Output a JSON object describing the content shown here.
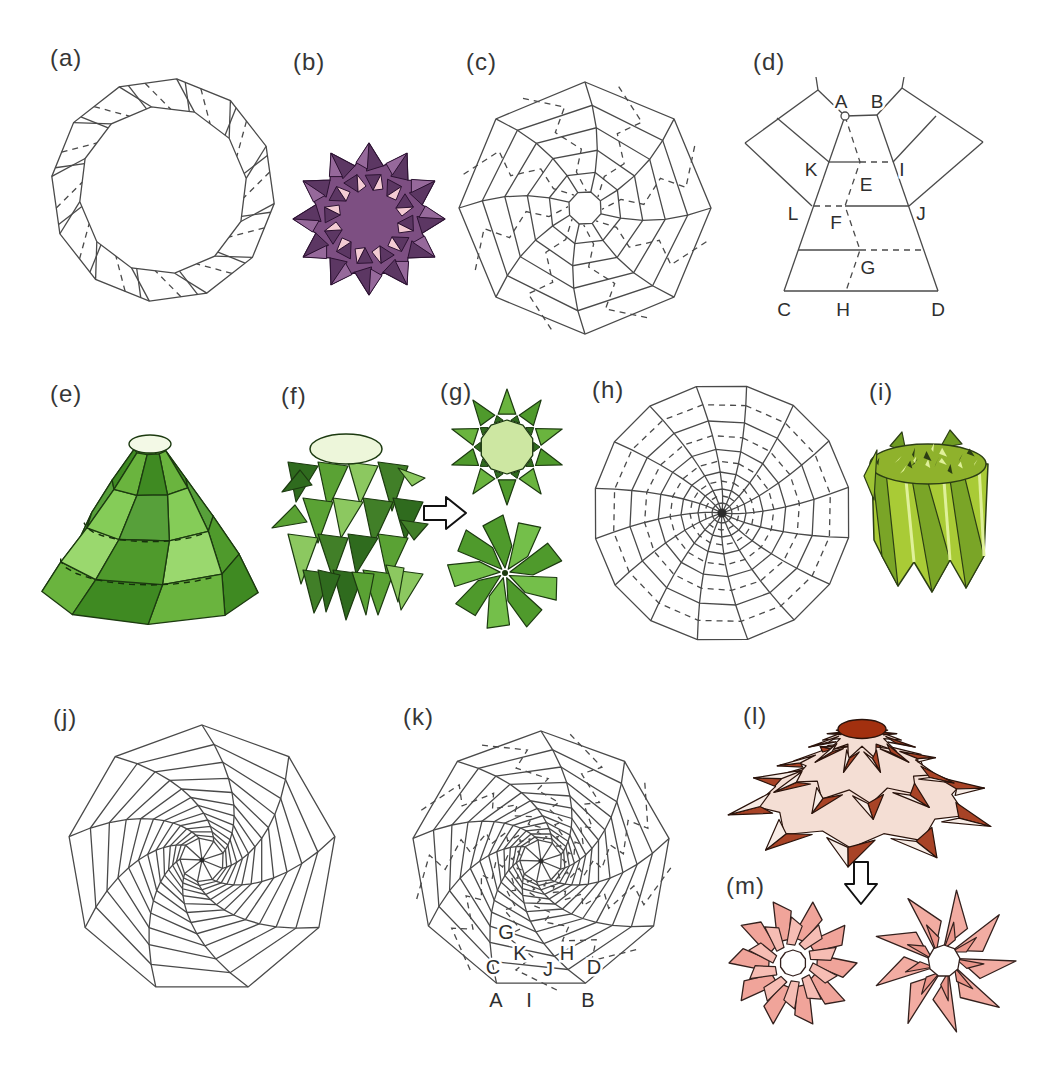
{
  "figure": {
    "background": "#ffffff",
    "line_color": "#4a4a4a",
    "label_color": "#363636"
  },
  "panels": {
    "a": {
      "label": "(a)",
      "type": "crease-pattern-dodecagon-ring"
    },
    "b": {
      "label": "(b)",
      "type": "folded-ring-model"
    },
    "c": {
      "label": "(c)",
      "type": "crease-pattern-octagon-web"
    },
    "d": {
      "label": "(d)",
      "type": "crease-unit-detail-diagram"
    },
    "e": {
      "label": "(e)",
      "type": "folded-cone-model"
    },
    "f": {
      "label": "(f)",
      "type": "folded-tower-model"
    },
    "g": {
      "label": "(g)",
      "type": "flattened-star-and-pinwheel-models"
    },
    "h": {
      "label": "(h)",
      "type": "crease-pattern-circular-web"
    },
    "i": {
      "label": "(i)",
      "type": "folded-cylinder-model"
    },
    "j": {
      "label": "(j)",
      "type": "crease-pattern-spiral-web"
    },
    "k": {
      "label": "(k)",
      "type": "crease-pattern-spiral-web-labeled"
    },
    "l": {
      "label": "(l)",
      "type": "folded-dome-model"
    },
    "m": {
      "label": "(m)",
      "type": "flattened-flower-models"
    }
  },
  "icons": {
    "flatten_arrow_right": "hollow-right-arrow",
    "flatten_arrow_down": "hollow-down-arrow"
  },
  "diagram_d": {
    "circle_marker_at": "A",
    "points": [
      {
        "t": "A",
        "x": 841,
        "y": 103
      },
      {
        "t": "B",
        "x": 877,
        "y": 103
      },
      {
        "t": "K",
        "x": 811,
        "y": 171
      },
      {
        "t": "E",
        "x": 866,
        "y": 186
      },
      {
        "t": "I",
        "x": 902,
        "y": 171
      },
      {
        "t": "L",
        "x": 793,
        "y": 215
      },
      {
        "t": "F",
        "x": 836,
        "y": 224
      },
      {
        "t": "J",
        "x": 921,
        "y": 215
      },
      {
        "t": "G",
        "x": 868,
        "y": 269
      },
      {
        "t": "C",
        "x": 784,
        "y": 311
      },
      {
        "t": "H",
        "x": 843,
        "y": 311
      },
      {
        "t": "D",
        "x": 938,
        "y": 311
      }
    ]
  },
  "diagram_k": {
    "points": [
      {
        "t": "G",
        "x": 506,
        "y": 934
      },
      {
        "t": "K",
        "x": 520,
        "y": 955
      },
      {
        "t": "C",
        "x": 493,
        "y": 969
      },
      {
        "t": "J",
        "x": 548,
        "y": 971
      },
      {
        "t": "H",
        "x": 567,
        "y": 955
      },
      {
        "t": "D",
        "x": 594,
        "y": 969
      },
      {
        "t": "A",
        "x": 496,
        "y": 1002
      },
      {
        "t": "I",
        "x": 529,
        "y": 1002
      },
      {
        "t": "B",
        "x": 588,
        "y": 1002
      }
    ]
  },
  "colors": {
    "purple": {
      "base": "#7d4f82",
      "dark": "#5c3763",
      "light": "#96699b",
      "pink": "#f3cbd3",
      "stroke": "#2c1232"
    },
    "greens": [
      "#6ab43e",
      "#4f9a2c",
      "#85cc58",
      "#3f8a22",
      "#9ad86e",
      "#57a03a"
    ],
    "green_stroke": "#1c3a10",
    "green_light_top": "#f3f9e6",
    "yellow_green": {
      "body": "#a9cb36",
      "dark": "#7aa527",
      "deep": "#2c3e14",
      "light": "#dff09a",
      "top": "#8fb22c",
      "spike": "#6f9c22"
    },
    "red": {
      "cap": "#a2300f",
      "arm_dark": "#a84326",
      "band": "#f4ded4",
      "arm_light": "#f7ece6",
      "stroke": "#2a130b"
    },
    "pink": {
      "petal": "#f0a49a",
      "petal2": "#f6bdb4",
      "blade": "#f2aca2",
      "blade2": "#ea958a",
      "stroke": "#33201d"
    },
    "letter_color": "#2e2e2e",
    "arrow_stroke": "#111111"
  }
}
